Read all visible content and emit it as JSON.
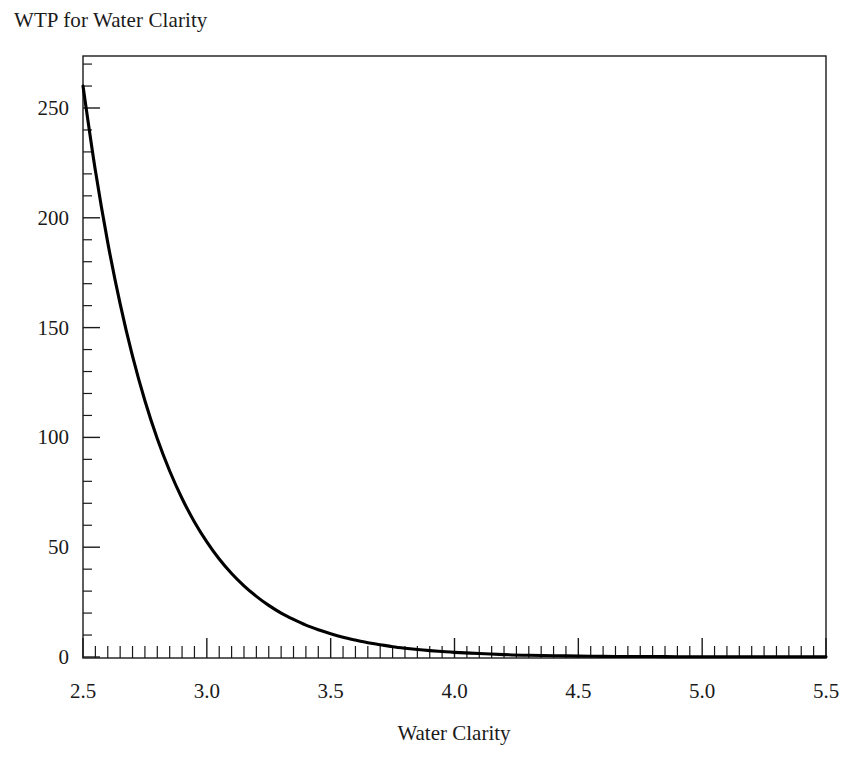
{
  "chart_data": {
    "type": "line",
    "title": "WTP for Water Clarity",
    "xlabel": "Water Clarity",
    "ylabel": "",
    "xlim": [
      2.5,
      5.5
    ],
    "ylim": [
      0,
      275
    ],
    "grid": false,
    "legend": null,
    "x_ticks": [
      2.5,
      3.0,
      3.5,
      4.0,
      4.5,
      5.0,
      5.5
    ],
    "x_tick_labels": [
      "2.5",
      "3.0",
      "3.5",
      "4.0",
      "4.5",
      "5.0",
      "5.5"
    ],
    "x_minor_tick_step": 0.05,
    "y_ticks": [
      0,
      50,
      100,
      150,
      200,
      250
    ],
    "y_tick_labels": [
      "0",
      "50",
      "100",
      "150",
      "200",
      "250"
    ],
    "y_minor_tick_step": 10,
    "series": [
      {
        "name": "WTP",
        "color": "#000000",
        "x": [
          2.5,
          2.55,
          2.6,
          2.65,
          2.7,
          2.75,
          2.8,
          2.85,
          2.9,
          2.95,
          3.0,
          3.05,
          3.1,
          3.15,
          3.2,
          3.25,
          3.3,
          3.35,
          3.4,
          3.45,
          3.5,
          3.55,
          3.6,
          3.65,
          3.7,
          3.75,
          3.8,
          3.85,
          3.9,
          3.95,
          4.0,
          4.1,
          4.2,
          4.3,
          4.4,
          4.5,
          4.6,
          4.7,
          4.8,
          4.9,
          5.0,
          5.1,
          5.2,
          5.3,
          5.4,
          5.5
        ],
        "y": [
          260.0,
          221.5,
          188.7,
          160.8,
          137.0,
          116.7,
          99.4,
          84.7,
          72.2,
          61.5,
          52.4,
          44.6,
          38.0,
          32.4,
          27.6,
          23.5,
          20.0,
          17.1,
          14.5,
          12.4,
          10.6,
          9.0,
          7.7,
          6.5,
          5.6,
          4.7,
          4.0,
          3.4,
          2.9,
          2.5,
          2.1,
          1.6,
          1.1,
          0.8,
          0.6,
          0.4,
          0.3,
          0.2,
          0.2,
          0.1,
          0.1,
          0.1,
          0.1,
          0.1,
          0.1,
          0.1
        ]
      }
    ],
    "annotations": []
  },
  "axes": {
    "title_text": "WTP for Water Clarity",
    "x_axis_title": "Water Clarity",
    "y_axis_title": ""
  }
}
